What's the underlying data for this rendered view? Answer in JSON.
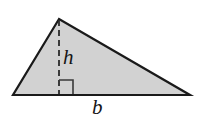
{
  "figure": {
    "name": "triangle-area-diagram",
    "canvas": {
      "width": 199,
      "height": 119,
      "background": "#ffffff"
    },
    "colors": {
      "fill": "#d2d2d2",
      "stroke": "#1a1a1a",
      "dash": "#2a2a2a",
      "right_angle": "#3a3a3a",
      "label": "#151515"
    },
    "shape": {
      "type": "triangle",
      "vertices": [
        {
          "name": "apex",
          "x": 59,
          "y": 19
        },
        {
          "name": "bottom-left",
          "x": 13,
          "y": 95
        },
        {
          "name": "bottom-right",
          "x": 190,
          "y": 95
        }
      ],
      "stroke_width": 2.2
    },
    "height_segment": {
      "from": {
        "x": 59,
        "y": 20
      },
      "to": {
        "x": 59,
        "y": 94
      },
      "stroke_width": 1.8,
      "dash_pattern": "6 4"
    },
    "right_angle_marker": {
      "x": 59,
      "y": 80,
      "size": 14,
      "stroke_width": 1.6
    },
    "labels": {
      "height": "h",
      "base": "b"
    }
  }
}
